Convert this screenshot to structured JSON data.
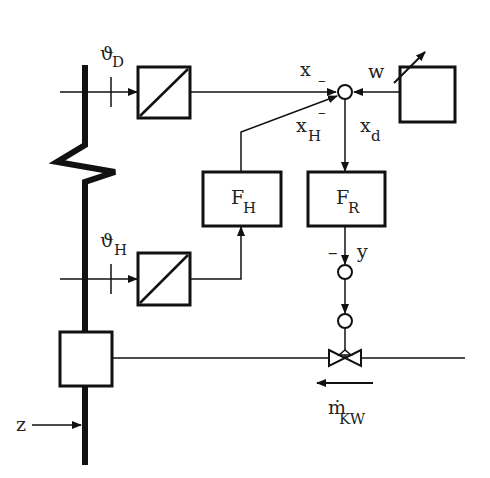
{
  "diagram": {
    "type": "control-loop-block-diagram",
    "labels": {
      "theta_D_main": "ϑ",
      "theta_D_sub": "D",
      "theta_H_main": "ϑ",
      "theta_H_sub": "H",
      "x": "x",
      "x_minus": "–",
      "xH_main": "x",
      "xH_sub": "H",
      "xH_minus": "–",
      "w": "w",
      "xd_main": "x",
      "xd_sub": "d",
      "FH_main": "F",
      "FH_sub": "H",
      "FR_main": "F",
      "FR_sub": "R",
      "y": "y",
      "y_minus": "–",
      "mKW_main": "ṁ",
      "mKW_sub": "KW",
      "z": "z"
    },
    "blocks": [
      {
        "id": "transducer-D",
        "kind": "converter"
      },
      {
        "id": "transducer-H",
        "kind": "converter"
      },
      {
        "id": "setpoint",
        "kind": "adjustable-setpoint"
      },
      {
        "id": "F_H",
        "kind": "controller-block"
      },
      {
        "id": "F_R",
        "kind": "controller-block"
      },
      {
        "id": "plant",
        "kind": "cooler"
      }
    ],
    "colors": {
      "ink": "#111111",
      "background": "#ffffff"
    }
  }
}
